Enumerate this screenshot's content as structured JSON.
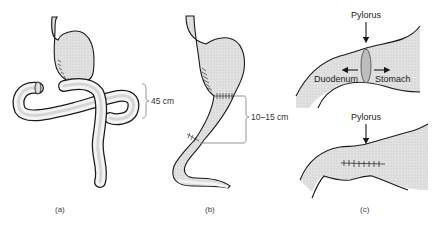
{
  "figure": {
    "panels": [
      {
        "id": "a",
        "label": "(a)",
        "measurement": "45 cm"
      },
      {
        "id": "b",
        "label": "(b)",
        "measurement": "10–15 cm"
      },
      {
        "id": "c",
        "label": "(c)",
        "top": {
          "pointer_label": "Pylorus",
          "left_arrow_label": "Duodenum",
          "right_arrow_label": "Stomach"
        },
        "bottom": {
          "pointer_label": "Pylorus"
        }
      }
    ],
    "colors": {
      "fill": "#d9d9d9",
      "outline": "#1a1a1a",
      "bracket": "#888888",
      "bowel_highlight": "#f2f2f2"
    }
  }
}
